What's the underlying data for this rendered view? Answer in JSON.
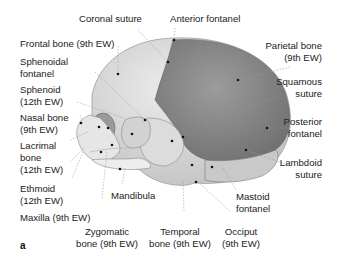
{
  "figure": {
    "panel_label": "a",
    "labels": {
      "coronal_suture": "Coronal suture",
      "anterior_fontanel": "Anterior fontanel",
      "frontal_bone": "Frontal bone (9th EW)",
      "parietal_bone": "Parietal bone\n(9th EW)",
      "sphenoidal_fontanel": "Sphenoidal\nfontanel",
      "squamous_suture": "Squamous\nsuture",
      "sphenoid": "Sphenoid\n(12th EW)",
      "posterior_fontanel": "Posterior\nfontanel",
      "nasal_bone": "Nasal bone\n(9th EW)",
      "lacrimal_bone": "Lacrimal\nbone\n(12th EW)",
      "lambdoid_suture": "Lambdoid\nsuture",
      "ethmoid": "Ethmoid\n(12th EW)",
      "mandibula": "Mandibula",
      "mastoid_fontanel": "Mastoid\nfontanel",
      "maxilla": "Maxilla (9th EW)",
      "zygomatic_bone": "Zygomatic\nbone (9th EW)",
      "temporal_bone": "Temporal\nbone (9th EW)",
      "occiput": "Occiput\n(9th EW)"
    },
    "colors": {
      "parietal": "#8a8a8a",
      "frontal": "#d6d6d6",
      "bone_light": "#e4e4e4",
      "leader_line": "#9a9a9a",
      "dot": "#111111"
    }
  }
}
